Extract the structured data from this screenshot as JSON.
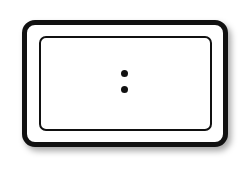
{
  "icon": {
    "name": "display-colon-icon",
    "colors": {
      "stroke": "#111111",
      "background": "#ffffff"
    }
  }
}
